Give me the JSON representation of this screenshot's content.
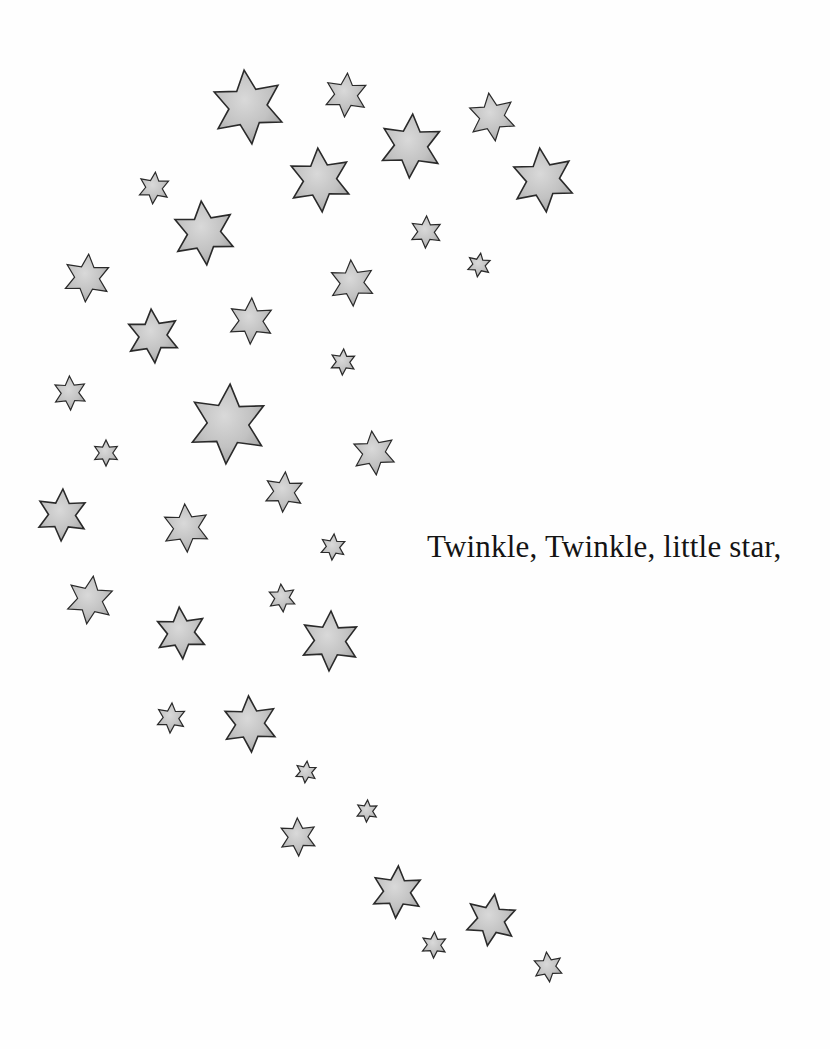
{
  "page": {
    "background": "#fefefe",
    "verse_line": "Twinkle, Twinkle, little star,"
  },
  "colors": {
    "star_fill_light": "#d6d6d6",
    "star_fill_dark": "#9e9e9e",
    "star_outline": "#2a2a2a",
    "text": "#141414"
  },
  "stars": [
    {
      "x": 248,
      "y": 107,
      "r": 37,
      "rot": -6
    },
    {
      "x": 346,
      "y": 95,
      "r": 22,
      "rot": 4
    },
    {
      "x": 492,
      "y": 117,
      "r": 24,
      "rot": -8
    },
    {
      "x": 411,
      "y": 146,
      "r": 32,
      "rot": 3
    },
    {
      "x": 320,
      "y": 180,
      "r": 32,
      "rot": -4
    },
    {
      "x": 543,
      "y": 180,
      "r": 32,
      "rot": -6
    },
    {
      "x": 154,
      "y": 188,
      "r": 16,
      "rot": 5
    },
    {
      "x": 204,
      "y": 233,
      "r": 32,
      "rot": -5
    },
    {
      "x": 426,
      "y": 232,
      "r": 16,
      "rot": 2
    },
    {
      "x": 479,
      "y": 265,
      "r": 12,
      "rot": 8
    },
    {
      "x": 87,
      "y": 278,
      "r": 24,
      "rot": 4
    },
    {
      "x": 352,
      "y": 283,
      "r": 23,
      "rot": -3
    },
    {
      "x": 251,
      "y": 321,
      "r": 23,
      "rot": 2
    },
    {
      "x": 153,
      "y": 336,
      "r": 27,
      "rot": -4
    },
    {
      "x": 343,
      "y": 362,
      "r": 13,
      "rot": 3
    },
    {
      "x": 70,
      "y": 393,
      "r": 17,
      "rot": -2
    },
    {
      "x": 228,
      "y": 424,
      "r": 40,
      "rot": 3
    },
    {
      "x": 106,
      "y": 453,
      "r": 13,
      "rot": 0
    },
    {
      "x": 374,
      "y": 453,
      "r": 22,
      "rot": -6
    },
    {
      "x": 284,
      "y": 492,
      "r": 20,
      "rot": 4
    },
    {
      "x": 62,
      "y": 515,
      "r": 26,
      "rot": 2
    },
    {
      "x": 186,
      "y": 528,
      "r": 24,
      "rot": -3
    },
    {
      "x": 333,
      "y": 547,
      "r": 13,
      "rot": 5
    },
    {
      "x": 90,
      "y": 600,
      "r": 24,
      "rot": 8
    },
    {
      "x": 282,
      "y": 598,
      "r": 14,
      "rot": -5
    },
    {
      "x": 181,
      "y": 633,
      "r": 26,
      "rot": -4
    },
    {
      "x": 330,
      "y": 641,
      "r": 30,
      "rot": 2
    },
    {
      "x": 171,
      "y": 718,
      "r": 15,
      "rot": 4
    },
    {
      "x": 250,
      "y": 724,
      "r": 28,
      "rot": -3
    },
    {
      "x": 306,
      "y": 772,
      "r": 11,
      "rot": 6
    },
    {
      "x": 367,
      "y": 811,
      "r": 11,
      "rot": 3
    },
    {
      "x": 298,
      "y": 837,
      "r": 19,
      "rot": -2
    },
    {
      "x": 397,
      "y": 892,
      "r": 26,
      "rot": 3
    },
    {
      "x": 491,
      "y": 920,
      "r": 26,
      "rot": 8
    },
    {
      "x": 434,
      "y": 945,
      "r": 13,
      "rot": 2
    },
    {
      "x": 548,
      "y": 967,
      "r": 15,
      "rot": -6
    }
  ]
}
